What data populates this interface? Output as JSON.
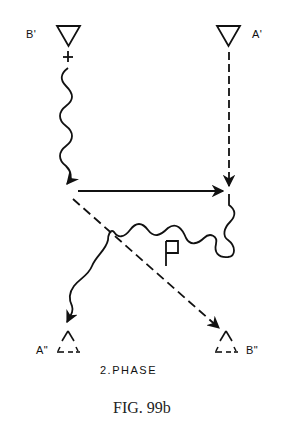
{
  "figure": {
    "caption": "FIG. 99b",
    "phase_label": "2.PHASE",
    "nodes": {
      "b_prime": {
        "label": "B'",
        "sign": "+",
        "style": "solid-triangle"
      },
      "a_prime": {
        "label": "A'",
        "style": "solid-triangle"
      },
      "a_double_prime": {
        "label": "A\"",
        "style": "dashed-triangle"
      },
      "b_double_prime": {
        "label": "B\"",
        "style": "dashed-triangle"
      }
    },
    "region_label": "P",
    "edges": [
      {
        "from": "B'",
        "to": "junction-left",
        "style": "wavy",
        "arrow": true
      },
      {
        "from": "A'",
        "to": "junction-right",
        "style": "dashed",
        "arrow": true
      },
      {
        "from": "junction-left",
        "to": "junction-right",
        "style": "solid",
        "arrow": true
      },
      {
        "from": "junction-left",
        "to": "B\"",
        "style": "dashed",
        "arrow": true
      },
      {
        "from": "junction-right",
        "to": "A\"",
        "style": "wavy",
        "arrow": true
      }
    ],
    "colors": {
      "ink": "#111111",
      "background": "#ffffff"
    }
  }
}
